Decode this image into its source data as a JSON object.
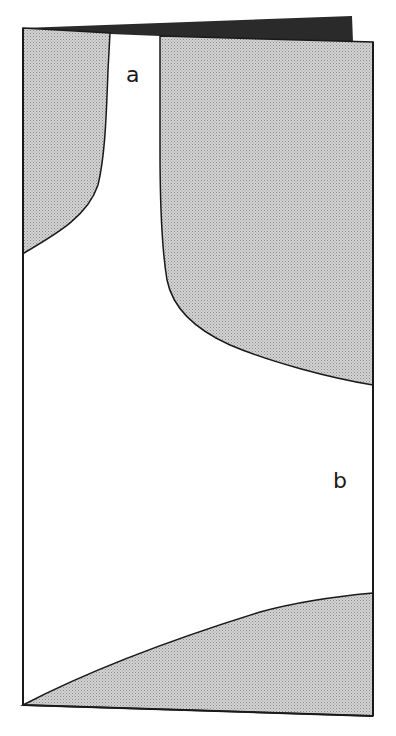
{
  "diagram": {
    "labels": {
      "a": "a",
      "b": "b"
    },
    "colors": {
      "outline": "#1a1a1a",
      "shaded": "#c8c8c8",
      "flap": "#2a2a2a",
      "background": "#ffffff"
    },
    "regions": [
      {
        "id": "upper-left-shaded",
        "fill": "shaded"
      },
      {
        "id": "upper-right-shaded",
        "fill": "shaded"
      },
      {
        "id": "bottom-shaded",
        "fill": "shaded"
      },
      {
        "id": "channel-a",
        "fill": "white"
      },
      {
        "id": "region-b",
        "fill": "white"
      }
    ]
  }
}
